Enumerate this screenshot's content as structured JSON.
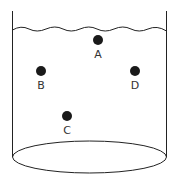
{
  "diagram": {
    "type": "container-with-liquid",
    "colors": {
      "stroke": "#222222",
      "dot": "#1a1a1a",
      "label": "#333333",
      "background": "#ffffff"
    },
    "points": [
      {
        "label": "A",
        "x": 98,
        "y": 40
      },
      {
        "label": "B",
        "x": 41,
        "y": 71
      },
      {
        "label": "C",
        "x": 67,
        "y": 116
      },
      {
        "label": "D",
        "x": 135,
        "y": 71
      }
    ]
  }
}
